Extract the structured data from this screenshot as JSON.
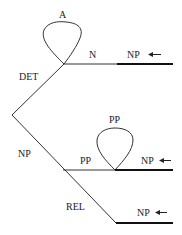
{
  "diagram": {
    "type": "transition-network",
    "colors": {
      "line": "#333333",
      "thick_line": "#111111",
      "text": "#222222",
      "background": "#ffffff"
    },
    "nodes": [
      {
        "id": "top",
        "x": 64,
        "y": 64
      },
      {
        "id": "left",
        "x": 12,
        "y": 115
      },
      {
        "id": "mid",
        "x": 63,
        "y": 170
      },
      {
        "id": "pp",
        "x": 115,
        "y": 170
      },
      {
        "id": "bottom",
        "x": 116,
        "y": 223
      }
    ],
    "arcs": [
      {
        "label": "A",
        "type": "loop",
        "at": "top"
      },
      {
        "label": "N",
        "from": "top",
        "to": "np-exit-1"
      },
      {
        "label": "DET",
        "from": "left",
        "to": "top"
      },
      {
        "label": "NP",
        "from": "left",
        "to": "bottom"
      },
      {
        "label": "PP",
        "from": "mid",
        "to": "pp"
      },
      {
        "label": "PP",
        "type": "loop",
        "at": "pp"
      },
      {
        "label": "REL",
        "from": "mid",
        "to": "bottom"
      }
    ],
    "labels": {
      "loop_a": "A",
      "n": "N",
      "np_exit_1": "NP",
      "det": "DET",
      "np_branch": "NP",
      "pp_loop": "PP",
      "pp_arc": "PP",
      "np_exit_2": "NP",
      "rel": "REL",
      "np_exit_3": "NP"
    },
    "arrow_glyph": "←"
  }
}
